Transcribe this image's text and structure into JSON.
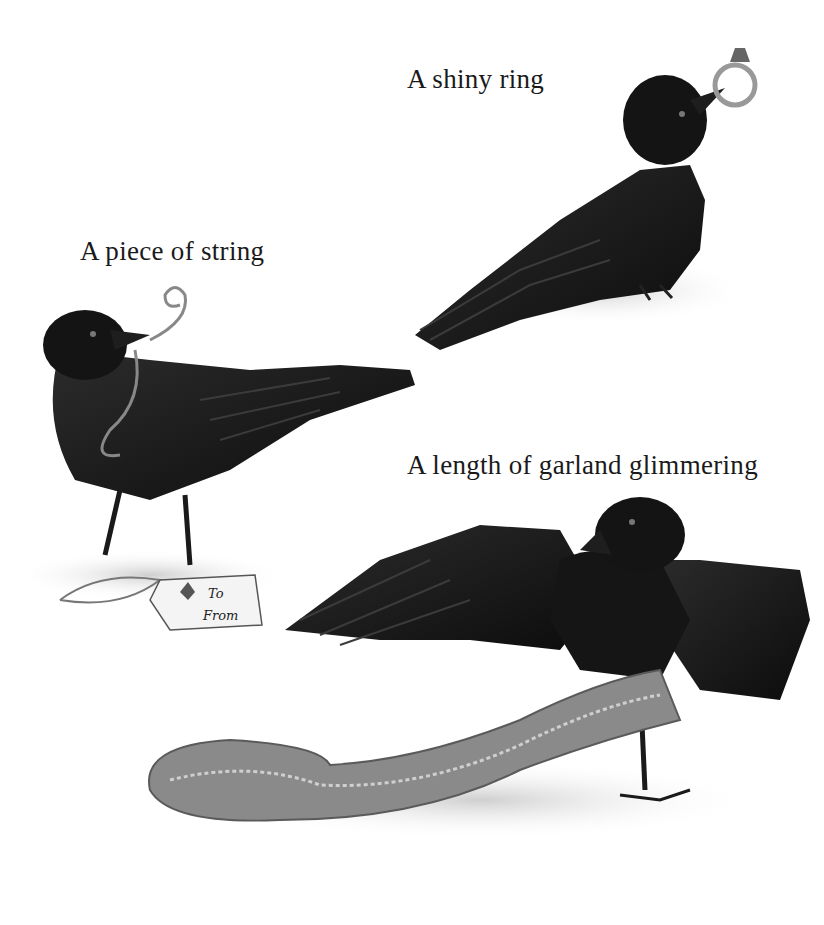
{
  "captions": {
    "ring": "A shiny ring",
    "string": "A piece of string",
    "garland": "A length of garland glimmering"
  },
  "gift_tag": {
    "to": "To",
    "from": "From"
  },
  "colors": {
    "background": "#ffffff",
    "crow": "#161616",
    "crow_highlight": "#3a3a3a",
    "shadow": "#d9d9d9",
    "garland": "#8a8a8a"
  }
}
